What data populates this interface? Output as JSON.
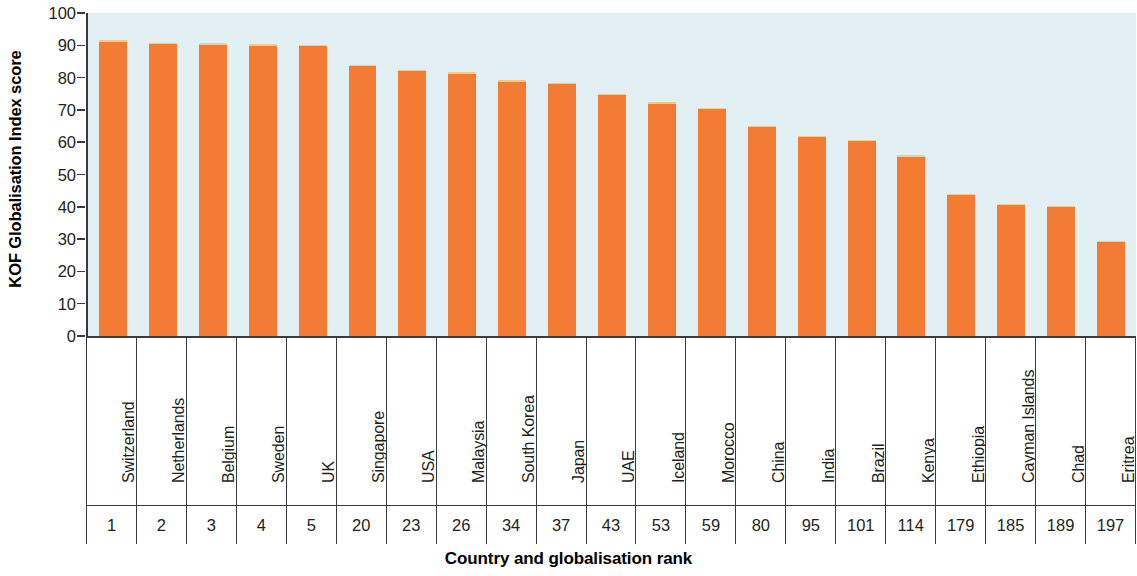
{
  "chart_data": {
    "type": "bar",
    "title": "",
    "xlabel": "Country and globalisation rank",
    "ylabel": "KOF Globalisation Index score",
    "ylim": [
      0,
      100
    ],
    "yticks": [
      100,
      90,
      80,
      70,
      60,
      50,
      40,
      30,
      20,
      10,
      0
    ],
    "grid": false,
    "legend": null,
    "bar_color": "#f47b33",
    "plot_background": "#e2eff3",
    "categories": [
      "Switzerland",
      "Netherlands",
      "Belgium",
      "Sweden",
      "UK",
      "Singapore",
      "USA",
      "Malaysia",
      "South Korea",
      "Japan",
      "UAE",
      "Iceland",
      "Morocco",
      "China",
      "India",
      "Brazil",
      "Kenya",
      "Ethiopia",
      "Cayman Islands",
      "Chad",
      "Eritrea"
    ],
    "ranks": [
      "1",
      "2",
      "3",
      "4",
      "5",
      "20",
      "23",
      "26",
      "34",
      "37",
      "43",
      "53",
      "59",
      "80",
      "95",
      "101",
      "114",
      "179",
      "185",
      "189",
      "197"
    ],
    "values": [
      91.5,
      90.8,
      90.7,
      90.3,
      90.2,
      84.0,
      82.5,
      81.6,
      79.2,
      78.4,
      75.0,
      72.3,
      70.6,
      65.1,
      62.0,
      60.7,
      56.0,
      44.0,
      41.0,
      40.3,
      29.5
    ]
  }
}
